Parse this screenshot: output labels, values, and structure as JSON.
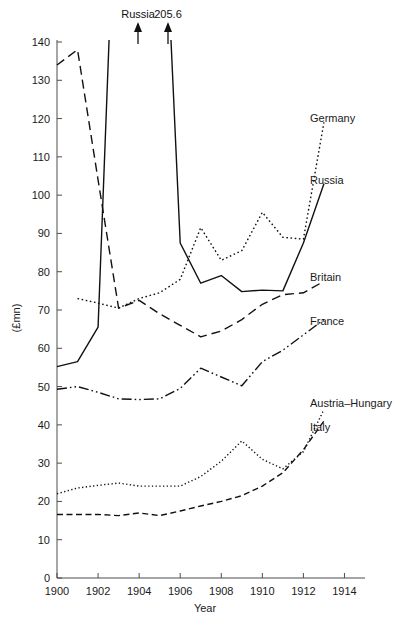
{
  "figure": {
    "ylabel": "(£mn)",
    "xlabel": "Year"
  },
  "annotations": [
    {
      "text": "Russia",
      "x": 1903.2,
      "y": 150
    },
    {
      "text": "205.6",
      "x": 1905.0,
      "y": 150
    }
  ],
  "series_labels": [
    {
      "name": "Germany",
      "text": "Germany"
    },
    {
      "name": "Russia",
      "text": "Russia"
    },
    {
      "name": "Britain",
      "text": "Britain"
    },
    {
      "name": "France",
      "text": "France"
    },
    {
      "name": "Austria-Hungary",
      "text": "Austria–Hungary"
    },
    {
      "name": "Italy",
      "text": "Italy"
    }
  ],
  "chart_data": {
    "type": "line",
    "title": "",
    "xlabel": "Year",
    "ylabel": "(£mn)",
    "xlim": [
      1900,
      1915
    ],
    "ylim": [
      0,
      143
    ],
    "xticks": [
      1900,
      1902,
      1904,
      1906,
      1908,
      1910,
      1912,
      1914
    ],
    "yticks": [
      0,
      10,
      20,
      30,
      40,
      50,
      60,
      70,
      80,
      90,
      100,
      110,
      120,
      130,
      140
    ],
    "grid": false,
    "legend": "inline-right-labels",
    "x": [
      1900,
      1901,
      1902,
      1903,
      1904,
      1905,
      1906,
      1907,
      1908,
      1909,
      1910,
      1911,
      1912,
      1913
    ],
    "series": [
      {
        "name": "Germany",
        "linestyle": "dotted",
        "values": [
          null,
          73.0,
          71.8,
          70.5,
          73.0,
          74.5,
          78.0,
          91.5,
          83.0,
          85.5,
          95.5,
          89.0,
          88.5,
          119.0
        ]
      },
      {
        "name": "Russia",
        "linestyle": "solid",
        "values": [
          55.2,
          56.5,
          65.5,
          205.6,
          205.6,
          205.6,
          87.5,
          77.0,
          79.0,
          74.8,
          75.2,
          75.0,
          87.5,
          103.0
        ],
        "note": "1903–1905 values run off the top of the axis; arrows annotated 205.6"
      },
      {
        "name": "Britain",
        "linestyle": "dashed-long",
        "values": [
          134.0,
          138.0,
          104.0,
          70.5,
          72.5,
          69.0,
          66.0,
          63.0,
          64.5,
          67.5,
          71.5,
          74.0,
          74.5,
          77.5
        ]
      },
      {
        "name": "France",
        "linestyle": "dash-dot",
        "values": [
          49.3,
          50.0,
          48.5,
          46.8,
          46.6,
          46.8,
          49.5,
          54.8,
          52.5,
          50.2,
          56.5,
          59.5,
          63.5,
          67.5
        ]
      },
      {
        "name": "Austria-Hungary",
        "linestyle": "dotted-fine",
        "values": [
          22.0,
          23.5,
          24.2,
          24.8,
          24.0,
          24.0,
          24.0,
          26.5,
          30.5,
          35.8,
          31.0,
          28.5,
          33.0,
          44.0
        ]
      },
      {
        "name": "Italy",
        "linestyle": "dashed-short",
        "values": [
          16.6,
          16.6,
          16.6,
          16.3,
          17.0,
          16.3,
          17.5,
          18.8,
          20.0,
          21.5,
          24.0,
          27.5,
          33.5,
          41.0
        ]
      }
    ]
  }
}
